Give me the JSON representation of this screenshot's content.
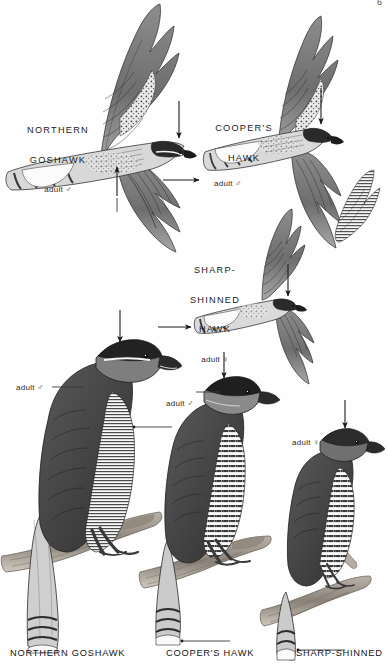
{
  "plate": {
    "title": "Accipiters comparison plate",
    "page_number": "6",
    "background_color": "#ffffff",
    "ink_color": "#1a1a1a"
  },
  "flight_figures": [
    {
      "id": "northern-goshawk-flight",
      "species": "NORTHERN\nGOSHAWK",
      "species_line1": "NORTHERN",
      "species_line2": "GOSHAWK",
      "age_sex": "adult ♂",
      "pose": "flight, from above"
    },
    {
      "id": "coopers-hawk-flight",
      "species_line1": "COOPER'S",
      "species_line2": "HAWK",
      "age_sex": "adult ♂",
      "pose": "flight, from above"
    },
    {
      "id": "sharp-shinned-hawk-flight",
      "species_line1": "SHARP-",
      "species_line2": "SHINNED",
      "species_line3": "HAWK",
      "age_sex": "adult ♀",
      "pose": "flight, from above"
    }
  ],
  "perched_figures": [
    {
      "id": "northern-goshawk-perched",
      "age_sex": "adult ♂",
      "caption": "NORTHERN GOSHAWK"
    },
    {
      "id": "coopers-hawk-perched",
      "age_sex": "adult ♂",
      "caption": "COOPER'S HAWK"
    },
    {
      "id": "sharp-shinned-hawk-perched",
      "age_sex": "adult ♀",
      "caption": "SHARP-SHINNED"
    }
  ],
  "annotations": {
    "arrow_count": 8,
    "leader_line_count": 6,
    "arrow_color": "#1a1a1a"
  }
}
